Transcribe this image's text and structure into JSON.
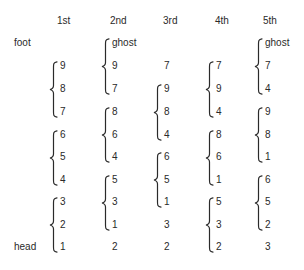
{
  "headers": [
    "1st",
    "2nd",
    "3rd",
    "4th",
    "5th"
  ],
  "row_labels": {
    "top": "foot",
    "bottom": "head"
  },
  "columns": [
    {
      "header": "1st",
      "cells": [
        "",
        "9",
        "8",
        "7",
        "6",
        "5",
        "4",
        "3",
        "2",
        "1"
      ],
      "groups": [
        [
          1,
          3
        ],
        [
          4,
          6
        ],
        [
          7,
          9
        ]
      ]
    },
    {
      "header": "2nd",
      "cells": [
        "ghost",
        "9",
        "7",
        "8",
        "6",
        "4",
        "5",
        "3",
        "1",
        "2"
      ],
      "groups": [
        [
          0,
          2
        ],
        [
          3,
          5
        ],
        [
          6,
          8
        ]
      ]
    },
    {
      "header": "3rd",
      "cells": [
        "",
        "7",
        "9",
        "8",
        "4",
        "6",
        "5",
        "1",
        "3",
        "2"
      ],
      "groups": [
        [
          2,
          4
        ],
        [
          5,
          7
        ]
      ]
    },
    {
      "header": "4th",
      "cells": [
        "",
        "7",
        "9",
        "4",
        "8",
        "6",
        "1",
        "5",
        "3",
        "2"
      ],
      "groups": [
        [
          1,
          3
        ],
        [
          4,
          6
        ],
        [
          7,
          9
        ]
      ]
    },
    {
      "header": "5th",
      "cells": [
        "ghost",
        "7",
        "4",
        "9",
        "8",
        "1",
        "6",
        "5",
        "2",
        "3"
      ],
      "groups": [
        [
          0,
          2
        ],
        [
          3,
          5
        ],
        [
          6,
          8
        ]
      ]
    }
  ]
}
